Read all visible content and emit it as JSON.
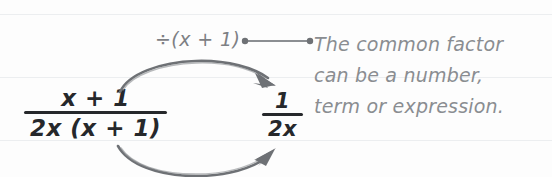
{
  "canvas": {
    "width": 552,
    "height": 177,
    "background": "#fdfdfd",
    "rule_color": "#eceef0"
  },
  "colors": {
    "expression_text": "#26282b",
    "annotation_text": "#8a8d91",
    "label_text": "#7d8084",
    "arc_stroke": "#6e7175",
    "connector_stroke": "#8b8e92"
  },
  "expressions": {
    "left": {
      "numerator": "x + 1",
      "denominator": "2x (x + 1)"
    },
    "right": {
      "numerator": "1",
      "denominator": "2x"
    }
  },
  "operation_label": "÷(x + 1)",
  "callout": {
    "lines": [
      "The common factor",
      "can be a number,",
      "term or expression."
    ]
  },
  "arrows": {
    "top_arc_label": "divide-top-arc",
    "bottom_arc_label": "divide-bottom-arc",
    "top_arrow_direction": "down-right",
    "bottom_arrow_direction": "up-right"
  }
}
